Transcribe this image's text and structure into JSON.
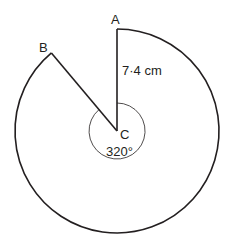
{
  "diagram": {
    "type": "major-sector",
    "points": {
      "A": {
        "label": "A"
      },
      "B": {
        "label": "B"
      },
      "C": {
        "label": "C"
      }
    },
    "radius_label": "7·4 cm",
    "angle_label": "320°",
    "angle_degrees": 320,
    "radius_cm": 7.4,
    "colors": {
      "stroke": "#231f20",
      "background": "#ffffff"
    }
  }
}
